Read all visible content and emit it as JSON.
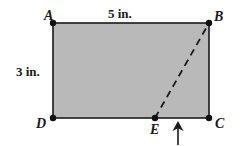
{
  "figure": {
    "background_color": "#ffffff",
    "shape": {
      "name": "rectangle-abcd",
      "fill_color": "#b9b9b9",
      "stroke_color": "#1a1a1a"
    },
    "vertices": [
      {
        "id": "A",
        "label": "A",
        "x": 53,
        "y": 23
      },
      {
        "id": "B",
        "label": "B",
        "x": 209,
        "y": 23
      },
      {
        "id": "C",
        "label": "C",
        "x": 209,
        "y": 118
      },
      {
        "id": "D",
        "label": "D",
        "x": 53,
        "y": 118
      },
      {
        "id": "E",
        "label": "E",
        "x": 155,
        "y": 118
      }
    ],
    "segments": [
      {
        "name": "segment-eb",
        "from": "E",
        "to": "B",
        "style": "dashed",
        "color": "#1a1a1a"
      }
    ],
    "dimensions": {
      "top": "5 in.",
      "left": "3 in."
    },
    "annotations": {
      "arrow": {
        "name": "up-arrow",
        "direction": "up",
        "x": 178,
        "y_tail": 144,
        "y_head": 122,
        "color": "#1a1a1a"
      }
    }
  }
}
